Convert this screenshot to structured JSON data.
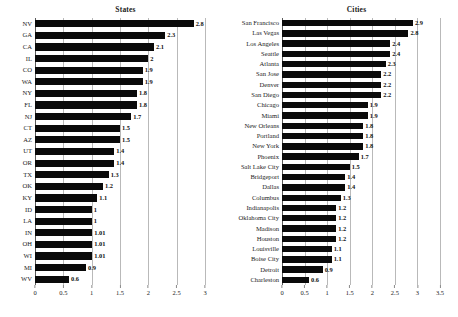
{
  "figure": {
    "background": "#ffffff",
    "bar_color": "#0a0a0a",
    "grid_color": "#b9b9b9",
    "axis_color": "#5a5a5a"
  },
  "panels": [
    {
      "key": "states",
      "title": "States"
    },
    {
      "key": "cities",
      "title": "Cities"
    }
  ],
  "chart_data": [
    {
      "type": "bar",
      "orientation": "horizontal",
      "title": "States",
      "xlabel": "",
      "ylabel": "",
      "xlim": [
        0,
        3
      ],
      "xticks": [
        "0",
        "0.5",
        "1",
        "1.5",
        "2",
        "2.5",
        "3"
      ],
      "xtick_values": [
        0,
        0.5,
        1,
        1.5,
        2,
        2.5,
        3
      ],
      "grid": true,
      "legend": "none",
      "categories": [
        "NV",
        "GA",
        "CA",
        "IL",
        "CO",
        "WA",
        "NY",
        "FL",
        "NJ",
        "CT",
        "AZ",
        "UT",
        "OR",
        "TX",
        "OK",
        "KY",
        "ID",
        "LA",
        "IN",
        "OH",
        "WI",
        "MI",
        "WV"
      ],
      "values": [
        2.8,
        2.3,
        2.1,
        2,
        1.9,
        1.9,
        1.8,
        1.8,
        1.7,
        1.5,
        1.5,
        1.4,
        1.4,
        1.3,
        1.2,
        1.1,
        1,
        1,
        1.01,
        1.01,
        1.01,
        0.9,
        0.6
      ],
      "value_labels": [
        "2.8",
        "2.3",
        "2.1",
        "2",
        "1.9",
        "1.9",
        "1.8",
        "1.8",
        "1.7",
        "1.5",
        "1.5",
        "1.4",
        "1.4",
        "1.3",
        "1.2",
        "1.1",
        "1",
        "1",
        "1.01",
        "1.01",
        "1.01",
        "0.9",
        "0.6"
      ]
    },
    {
      "type": "bar",
      "orientation": "horizontal",
      "title": "Cities",
      "xlabel": "",
      "ylabel": "",
      "xlim": [
        0,
        3.5
      ],
      "xticks": [
        "0",
        "0.5",
        "1",
        "1.5",
        "2",
        "2.5",
        "3",
        "3.5"
      ],
      "xtick_values": [
        0,
        0.5,
        1,
        1.5,
        2,
        2.5,
        3,
        3.5
      ],
      "grid": true,
      "legend": "none",
      "categories": [
        "San Francisco",
        "Las Vegas",
        "Los Angeles",
        "Seattle",
        "Atlanta",
        "San Jose",
        "Denver",
        "San Diego",
        "Chicago",
        "Miami",
        "New Orleans",
        "Portland",
        "New York",
        "Phoenix",
        "Salt Lake City",
        "Bridgeport",
        "Dallas",
        "Columbus",
        "Indianapolis",
        "Oklahoma City",
        "Madison",
        "Houston",
        "Louisville",
        "Boise City",
        "Detroit",
        "Charleston"
      ],
      "values": [
        2.9,
        2.8,
        2.4,
        2.4,
        2.3,
        2.2,
        2.2,
        2.2,
        1.9,
        1.9,
        1.8,
        1.8,
        1.8,
        1.7,
        1.5,
        1.4,
        1.4,
        1.3,
        1.2,
        1.2,
        1.2,
        1.2,
        1.1,
        1.1,
        0.9,
        0.6
      ],
      "value_labels": [
        "2.9",
        "2.8",
        "2.4",
        "2.4",
        "2.3",
        "2.2",
        "2.2",
        "2.2",
        "1.9",
        "1.9",
        "1.8",
        "1.8",
        "1.8",
        "1.7",
        "1.5",
        "1.4",
        "1.4",
        "1.3",
        "1.2",
        "1.2",
        "1.2",
        "1.2",
        "1.1",
        "1.1",
        "0.9",
        "0.6"
      ]
    }
  ]
}
